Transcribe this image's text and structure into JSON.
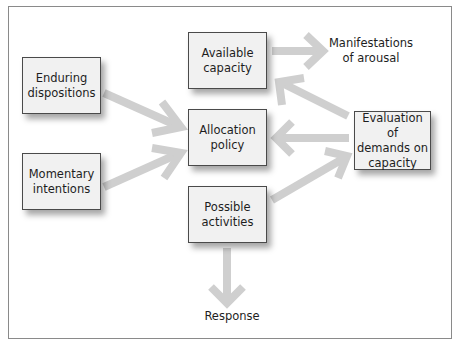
{
  "diagram": {
    "type": "flow diagram",
    "boxes": {
      "enduring": {
        "line1": "Enduring",
        "line2": "dispositions"
      },
      "momentary": {
        "line1": "Momentary",
        "line2": "intentions"
      },
      "available": {
        "line1": "Available",
        "line2": "capacity"
      },
      "allocation": {
        "line1": "Allocation",
        "line2": "policy"
      },
      "possible": {
        "line1": "Possible",
        "line2": "activities"
      },
      "evaluation": {
        "line1": "Evaluation of",
        "line2": "demands on",
        "line3": "capacity"
      }
    },
    "labels": {
      "manifestations": {
        "line1": "Manifestations",
        "line2": "of arousal"
      },
      "response": "Response"
    },
    "edges": [
      {
        "from": "Enduring dispositions",
        "to": "Allocation policy"
      },
      {
        "from": "Momentary intentions",
        "to": "Allocation policy"
      },
      {
        "from": "Available capacity",
        "to": "Manifestations of arousal"
      },
      {
        "from": "Evaluation of demands on capacity",
        "to": "Available capacity"
      },
      {
        "from": "Evaluation of demands on capacity",
        "to": "Allocation policy"
      },
      {
        "from": "Possible activities",
        "to": "Evaluation of demands on capacity"
      },
      {
        "from": "Possible activities",
        "to": "Response"
      }
    ],
    "colors": {
      "arrow": "#cfcfcf",
      "box_fill": "#f1f1f1",
      "box_border": "#4a4a4a",
      "frame_border": "#8a8a8a"
    }
  }
}
